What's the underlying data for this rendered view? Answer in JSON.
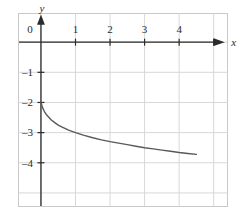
{
  "chart_data": {
    "type": "line",
    "title": "",
    "subtitle": "",
    "xlabel": "x",
    "ylabel": "y",
    "xlim": [
      -0.65,
      5.4
    ],
    "ylim": [
      -5.45,
      0.95
    ],
    "grid": true,
    "legend": null,
    "x_ticks": [
      0,
      1,
      2,
      3,
      4
    ],
    "x_tick_labels": [
      "0",
      "1",
      "2",
      "3",
      "4"
    ],
    "y_ticks": [
      -1,
      -2,
      -3,
      -4
    ],
    "y_tick_labels": [
      "–1",
      "–2",
      "–3",
      "–4"
    ],
    "x_unlabeled_ticks": [
      5
    ],
    "series": [
      {
        "name": "curve",
        "color": "#595959",
        "x": [
          0.0,
          0.05,
          0.1,
          0.15,
          0.2,
          0.3,
          0.4,
          0.5,
          0.6,
          0.8,
          1.0,
          1.25,
          1.5,
          1.75,
          2.0,
          2.25,
          2.5,
          2.75,
          3.0,
          3.25,
          3.5,
          3.75,
          4.0,
          4.25,
          4.5
        ],
        "y": [
          -2.0,
          -2.18,
          -2.3,
          -2.39,
          -2.46,
          -2.58,
          -2.67,
          -2.75,
          -2.81,
          -2.92,
          -3.0,
          -3.09,
          -3.17,
          -3.24,
          -3.3,
          -3.35,
          -3.4,
          -3.45,
          -3.5,
          -3.54,
          -3.58,
          -3.62,
          -3.66,
          -3.69,
          -3.72
        ]
      }
    ],
    "axis_color": "#2b2b2b",
    "grid_color": "#d8d8d8",
    "border_color": "#c8c8c8",
    "curve_color": "#595959",
    "background_color": "#ffffff"
  },
  "axes": {
    "x_axis_label": "x",
    "y_axis_label": "y"
  }
}
